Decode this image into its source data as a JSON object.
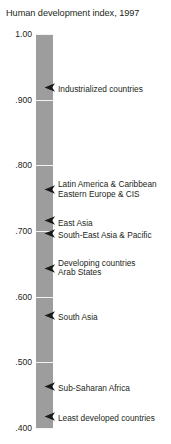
{
  "chart": {
    "title": "Human development index, 1997"
  },
  "axis": {
    "ticks": [
      {
        "label": "1.00",
        "value": 1.0
      },
      {
        "label": ".900",
        "value": 0.9
      },
      {
        "label": ".800",
        "value": 0.8
      },
      {
        "label": ".700",
        "value": 0.7
      },
      {
        "label": ".600",
        "value": 0.6
      },
      {
        "label": ".500",
        "value": 0.5
      },
      {
        "label": ".400",
        "value": 0.4
      }
    ]
  },
  "annotations": [
    {
      "label": "Industrialized countries",
      "value": 0.925
    },
    {
      "label": "Latin America & Caribbean",
      "value": 0.769
    },
    {
      "label": "Eastern Europe & CIS",
      "value": 0.756
    },
    {
      "label": "East Asia",
      "value": 0.722
    },
    {
      "label": "South-East Asia & Pacific",
      "value": 0.703
    },
    {
      "label": "Developing countries",
      "value": 0.65
    },
    {
      "label": "Arab States",
      "value": 0.637
    },
    {
      "label": "South Asia",
      "value": 0.578
    },
    {
      "label": "Sub-Saharan Africa",
      "value": 0.47
    },
    {
      "label": "Least developed countries",
      "value": 0.424
    }
  ],
  "colors": {
    "band": "#9d9d9d",
    "gridline": "#f2f2f2",
    "text": "#231f20"
  },
  "chart_data": {
    "type": "bar",
    "title": "Human development index, 1997",
    "xlabel": "",
    "ylabel": "Human development index",
    "ylim": [
      0.4,
      1.0
    ],
    "grid": true,
    "legend": "none",
    "orientation": "vertical-scale-with-pointers",
    "categories": [
      "Industrialized countries",
      "Latin America & Caribbean",
      "Eastern Europe & CIS",
      "East Asia",
      "South-East Asia & Pacific",
      "Developing countries",
      "Arab States",
      "South Asia",
      "Sub-Saharan Africa",
      "Least developed countries"
    ],
    "values": [
      0.925,
      0.769,
      0.756,
      0.722,
      0.703,
      0.65,
      0.637,
      0.578,
      0.47,
      0.424
    ],
    "tick_labels": [
      "1.00",
      ".900",
      ".800",
      ".700",
      ".600",
      ".500",
      ".400"
    ],
    "tick_values": [
      1.0,
      0.9,
      0.8,
      0.7,
      0.6,
      0.5,
      0.4
    ]
  }
}
